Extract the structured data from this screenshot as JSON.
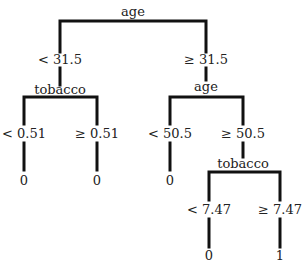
{
  "tree": {
    "root": {
      "feature": "age",
      "left": {
        "condition": "< 31.5",
        "node": {
          "feature": "tobacco",
          "left": {
            "condition": "< 0.51",
            "leaf": "0"
          },
          "right": {
            "condition": "≥ 0.51",
            "leaf": "0"
          }
        }
      },
      "right": {
        "condition": "≥ 31.5",
        "node": {
          "feature": "age",
          "left": {
            "condition": "< 50.5",
            "leaf": "0"
          },
          "right": {
            "condition": "≥ 50.5",
            "node": {
              "feature": "tobacco",
              "left": {
                "condition": "< 7.47",
                "leaf": "0"
              },
              "right": {
                "condition": "≥ 7.47",
                "leaf": "1"
              }
            }
          }
        }
      }
    }
  },
  "colors": {
    "line": "#111111",
    "text": "#222222",
    "background": "#ffffff"
  }
}
